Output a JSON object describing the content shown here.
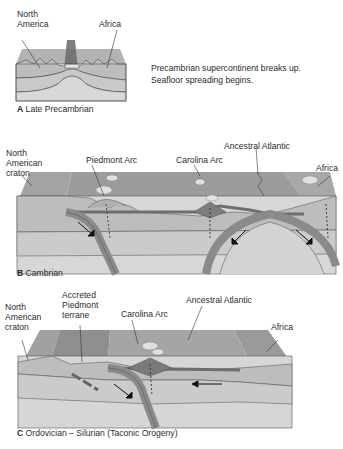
{
  "panel_a": {
    "labels": {
      "north_america": "North\nAmerica",
      "africa": "Africa"
    },
    "caption_letter": "A",
    "caption_text": "Late Precambrian",
    "description_line1": "Precambrian supercontinent breaks up.",
    "description_line2": "Seafloor spreading begins."
  },
  "panel_b": {
    "labels": {
      "north_american_craton": "North\nAmerican\ncraton",
      "piedmont_arc": "Piedmont Arc",
      "carolina_arc": "Carolina Arc",
      "ancestral_atlantic": "Ancestral Atlantic",
      "africa": "Africa"
    },
    "caption_letter": "B",
    "caption_text": "Cambrian"
  },
  "panel_c": {
    "labels": {
      "north_american_craton": "North\nAmerican\ncraton",
      "accreted_piedmont_terrane": "Accreted\nPiedmont\nterrane",
      "carolina_arc": "Carolina Arc",
      "ancestral_atlantic": "Ancestral Atlantic",
      "africa": "Africa"
    },
    "caption_letter": "C",
    "caption_text": "Ordovician – Silurian (Taconic Orogeny)"
  },
  "colors": {
    "crust_top": "#a9a9a9",
    "ocean_surface": "#9e9e9e",
    "upper_layer": "#bdbdbd",
    "middle_layer": "#c9c9c9",
    "lower_layer": "#d6d6d6",
    "arc": "#7e7e7e",
    "outline": "#4a4a4a"
  }
}
